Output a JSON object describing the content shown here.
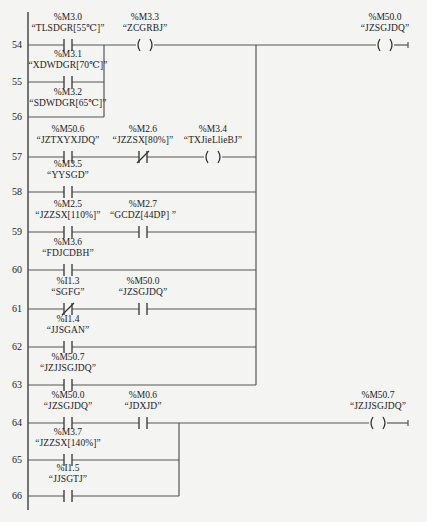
{
  "diagram": {
    "type": "ladder-logic",
    "rows": [
      {
        "num": "54",
        "y": 45
      },
      {
        "num": "55",
        "y": 82
      },
      {
        "num": "56",
        "y": 117
      },
      {
        "num": "57",
        "y": 157
      },
      {
        "num": "58",
        "y": 192
      },
      {
        "num": "59",
        "y": 232
      },
      {
        "num": "60",
        "y": 270
      },
      {
        "num": "61",
        "y": 309
      },
      {
        "num": "62",
        "y": 347
      },
      {
        "num": "63",
        "y": 385
      },
      {
        "num": "64",
        "y": 423
      },
      {
        "num": "65",
        "y": 460
      },
      {
        "num": "66",
        "y": 496
      }
    ],
    "elements": [
      {
        "id": "c-m3-0",
        "kind": "contact-no",
        "row": "54",
        "x": 68,
        "address": "%M3.0",
        "symbol": "“TLSDGR[55℃]”"
      },
      {
        "id": "coil-m3-3",
        "kind": "coil",
        "row": "54",
        "x": 145,
        "address": "%M3.3",
        "symbol": "“ZCGRBJ”"
      },
      {
        "id": "coil-m50-0",
        "kind": "coil",
        "row": "54",
        "x": 385,
        "address": "%M50.0",
        "symbol": "“JZSGJDQ”"
      },
      {
        "id": "c-m3-1",
        "kind": "contact-no",
        "row": "55",
        "x": 68,
        "address": "%M3.1",
        "symbol": "“XDWDGR[70℃]”"
      },
      {
        "id": "c-m3-2",
        "kind": "label-only",
        "row": "56",
        "x": 68,
        "address": "%M3.2",
        "symbol": "“SDWDGR[65℃]”"
      },
      {
        "id": "c-m50-6",
        "kind": "contact-no",
        "row": "57",
        "x": 68,
        "address": "%M50.6",
        "symbol": "“JZTXYXJDQ”"
      },
      {
        "id": "c-m2-6",
        "kind": "contact-nc",
        "row": "57",
        "x": 143,
        "address": "%M2.6",
        "symbol": "“JZZSX[80%]”"
      },
      {
        "id": "coil-m3-4",
        "kind": "coil",
        "row": "57",
        "x": 213,
        "address": "%M3.4",
        "symbol": "“TXJieLlieBJ”"
      },
      {
        "id": "c-m3-5",
        "kind": "contact-no",
        "row": "58",
        "x": 68,
        "address": "%M3.5",
        "symbol": "“YYSGD”"
      },
      {
        "id": "c-m2-5",
        "kind": "contact-no",
        "row": "59",
        "x": 68,
        "address": "%M2.5",
        "symbol": "“JZZSX[110%]”"
      },
      {
        "id": "c-m2-7",
        "kind": "contact-no",
        "row": "59",
        "x": 143,
        "address": "%M2.7",
        "symbol": "“GCDZ[44DP] ”"
      },
      {
        "id": "c-m3-6",
        "kind": "contact-no",
        "row": "60",
        "x": 68,
        "address": "%M3.6",
        "symbol": "“FDJCDBH”"
      },
      {
        "id": "c-i1-3",
        "kind": "contact-nc",
        "row": "61",
        "x": 68,
        "address": "%I1.3",
        "symbol": "“SGFG”"
      },
      {
        "id": "c-m50-0-b",
        "kind": "contact-no",
        "row": "61",
        "x": 143,
        "address": "%M50.0",
        "symbol": "“JZSGJDQ”"
      },
      {
        "id": "c-i1-4",
        "kind": "contact-no",
        "row": "62",
        "x": 68,
        "address": "%I1.4",
        "symbol": "“JJSGAN”"
      },
      {
        "id": "c-m50-7",
        "kind": "contact-no",
        "row": "63",
        "x": 68,
        "address": "%M50.7",
        "symbol": "“JZJJSGJDQ”"
      },
      {
        "id": "c-m50-0-c",
        "kind": "contact-no",
        "row": "64",
        "x": 68,
        "address": "%M50.0",
        "symbol": "“JZSGJDQ”"
      },
      {
        "id": "c-m0-6",
        "kind": "contact-no",
        "row": "64",
        "x": 143,
        "address": "%M0.6",
        "symbol": "“JDXJD”"
      },
      {
        "id": "coil-m50-7",
        "kind": "coil",
        "row": "64",
        "x": 378,
        "address": "%M50.7",
        "symbol": "“JZJJSGJDQ”"
      },
      {
        "id": "c-m3-7",
        "kind": "contact-no",
        "row": "65",
        "x": 68,
        "address": "%M3.7",
        "symbol": "“JZZSX[140%]”"
      },
      {
        "id": "c-i1-5",
        "kind": "contact-no",
        "row": "66",
        "x": 68,
        "address": "%I1.5",
        "symbol": "“JJSGTJ”"
      }
    ],
    "colors": {
      "line": "#555555",
      "text": "#222222",
      "background": "#f4f4f2"
    }
  }
}
